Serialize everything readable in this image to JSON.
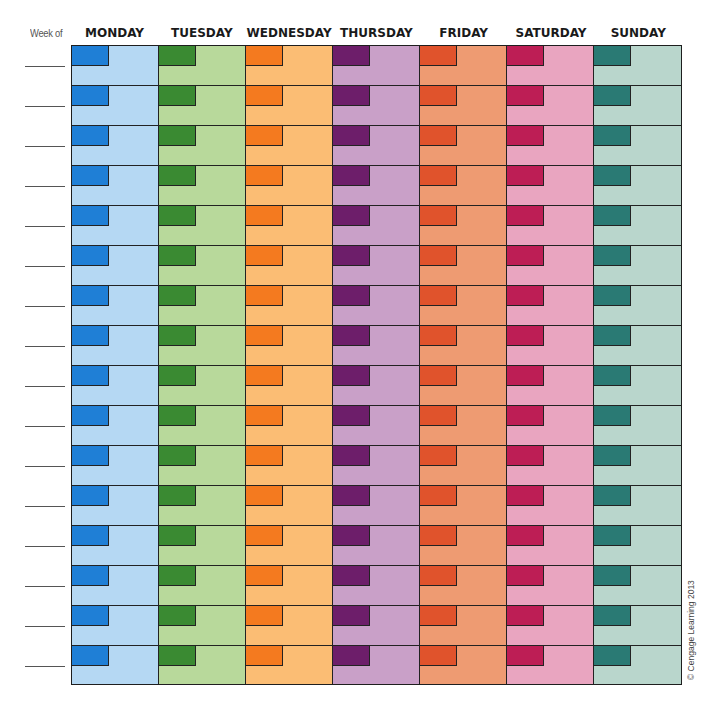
{
  "header": {
    "week_of_label": "Week of"
  },
  "days": [
    {
      "label": "MONDAY",
      "tab_color": "#1f7fd6",
      "fill_color": "#b5d8f3"
    },
    {
      "label": "TUESDAY",
      "tab_color": "#3a8a32",
      "fill_color": "#b8d99b"
    },
    {
      "label": "WEDNESDAY",
      "tab_color": "#f47a1f",
      "fill_color": "#fbbd74"
    },
    {
      "label": "THURSDAY",
      "tab_color": "#6d1e6a",
      "fill_color": "#c9a0c8"
    },
    {
      "label": "FRIDAY",
      "tab_color": "#e0532c",
      "fill_color": "#ee9b72"
    },
    {
      "label": "SATURDAY",
      "tab_color": "#bd1e55",
      "fill_color": "#e9a5c0"
    },
    {
      "label": "SUNDAY",
      "tab_color": "#2a7a74",
      "fill_color": "#b9d6cc"
    }
  ],
  "weeks": {
    "count": 16,
    "week_line_values": [
      "",
      "",
      "",
      "",
      "",
      "",
      "",
      "",
      "",
      "",
      "",
      "",
      "",
      "",
      "",
      ""
    ]
  },
  "footer": {
    "copyright": "© Cengage Learning 2013"
  }
}
